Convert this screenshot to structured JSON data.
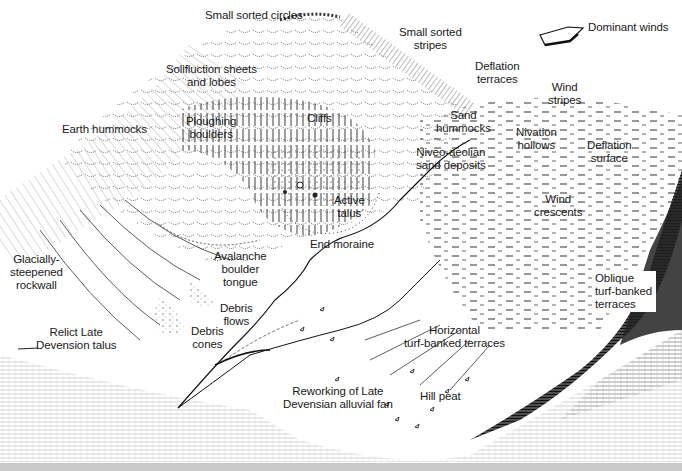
{
  "figure": {
    "legend": {
      "icon": "wind-arrow-icon",
      "label": "Dominant winds"
    },
    "labels": [
      {
        "id": "small-sorted-circles",
        "lines": [
          "Small sorted circles"
        ],
        "x": 205,
        "y": 9
      },
      {
        "id": "small-sorted-stripes",
        "lines": [
          "Small sorted",
          "stripes"
        ],
        "x": 399,
        "y": 27
      },
      {
        "id": "dominant-winds",
        "lines": [
          "Dominant winds"
        ],
        "x": 588,
        "y": 21
      },
      {
        "id": "deflation-terraces",
        "lines": [
          "Deflation",
          "terraces"
        ],
        "x": 475,
        "y": 59
      },
      {
        "id": "solifluction-sheets-and-lobes",
        "lines": [
          "Solifluction sheets",
          "and lobes"
        ],
        "x": 166,
        "y": 63
      },
      {
        "id": "wind-stripes",
        "lines": [
          "Wind",
          "stripes"
        ],
        "x": 548,
        "y": 81
      },
      {
        "id": "earth-hummocks",
        "lines": [
          "Earth hummocks"
        ],
        "x": 62,
        "y": 123
      },
      {
        "id": "ploughing-boulders",
        "lines": [
          "Ploughing",
          "boulders"
        ],
        "x": 186,
        "y": 115
      },
      {
        "id": "cliffs",
        "lines": [
          "Cliffs"
        ],
        "x": 307,
        "y": 112
      },
      {
        "id": "sand-hummocks",
        "lines": [
          "Sand",
          "hummocks"
        ],
        "x": 436,
        "y": 109
      },
      {
        "id": "nivation-hollows",
        "lines": [
          "Nivation",
          "hollows"
        ],
        "x": 516,
        "y": 125
      },
      {
        "id": "deflation-surface",
        "lines": [
          "Deflation",
          "surface"
        ],
        "x": 587,
        "y": 138
      },
      {
        "id": "niveo-aeolian-sand-deposits",
        "lines": [
          "Niveo-aeolian",
          "sand deposits"
        ],
        "x": 416,
        "y": 144
      },
      {
        "id": "active-talus",
        "lines": [
          "Active",
          "talus"
        ],
        "x": 334,
        "y": 194
      },
      {
        "id": "wind-crescents",
        "lines": [
          "Wind",
          "crescents"
        ],
        "x": 534,
        "y": 194
      },
      {
        "id": "end-moraine",
        "lines": [
          "End moraine"
        ],
        "x": 310,
        "y": 238
      },
      {
        "id": "glacially-steepened-rockwall",
        "lines": [
          "Glacially-",
          "steepened",
          "rockwall"
        ],
        "x": 12,
        "y": 254
      },
      {
        "id": "avalanche-boulder-tongue",
        "lines": [
          "Avalanche",
          "boulder",
          "tongue"
        ],
        "x": 215,
        "y": 250
      },
      {
        "id": "oblique-turf-banked-terraces",
        "lines": [
          "Oblique",
          "turf-banked",
          "terraces"
        ],
        "x": 594,
        "y": 273,
        "boxed": true
      },
      {
        "id": "debris-flows",
        "lines": [
          "Debris",
          "flows"
        ],
        "x": 221,
        "y": 302
      },
      {
        "id": "debris-cones",
        "lines": [
          "Debris",
          "cones"
        ],
        "x": 191,
        "y": 325
      },
      {
        "id": "relict-late-devension-talus",
        "lines": [
          "Relict Late",
          "Devension talus"
        ],
        "x": 37,
        "y": 326
      },
      {
        "id": "horizontal-turf-banked-terraces",
        "lines": [
          "Horizontal",
          "turf-banked terraces"
        ],
        "x": 404,
        "y": 324
      },
      {
        "id": "reworking-late-devensian-alluvial-fan",
        "lines": [
          "Reworking of Late",
          "Devensian alluvial fan"
        ],
        "x": 283,
        "y": 385
      },
      {
        "id": "hill-peat",
        "lines": [
          "Hill peat"
        ],
        "x": 420,
        "y": 390
      }
    ]
  }
}
